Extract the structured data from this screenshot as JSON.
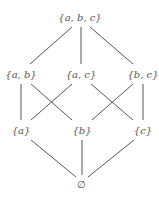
{
  "diagram": {
    "type": "hasse-diagram",
    "title": "",
    "edge_color": "#555555",
    "nodes": [
      {
        "id": "abc",
        "label": "{a, b, c}",
        "x": 80,
        "y": 17
      },
      {
        "id": "ab",
        "label": "{a, b}",
        "x": 21,
        "y": 74
      },
      {
        "id": "ac",
        "label": "{a, c}",
        "x": 81,
        "y": 74
      },
      {
        "id": "bc",
        "label": "{b, c}",
        "x": 143,
        "y": 74
      },
      {
        "id": "a",
        "label": "{a}",
        "x": 21,
        "y": 130
      },
      {
        "id": "b",
        "label": "{b}",
        "x": 82,
        "y": 130
      },
      {
        "id": "c",
        "label": "{c}",
        "x": 143,
        "y": 130
      },
      {
        "id": "empty",
        "label": "∅",
        "x": 81,
        "y": 184
      }
    ],
    "edges": [
      [
        "abc",
        "ab"
      ],
      [
        "abc",
        "ac"
      ],
      [
        "abc",
        "bc"
      ],
      [
        "ab",
        "a"
      ],
      [
        "ab",
        "b"
      ],
      [
        "ac",
        "a"
      ],
      [
        "ac",
        "c"
      ],
      [
        "bc",
        "b"
      ],
      [
        "bc",
        "c"
      ],
      [
        "a",
        "empty"
      ],
      [
        "b",
        "empty"
      ],
      [
        "c",
        "empty"
      ]
    ]
  }
}
